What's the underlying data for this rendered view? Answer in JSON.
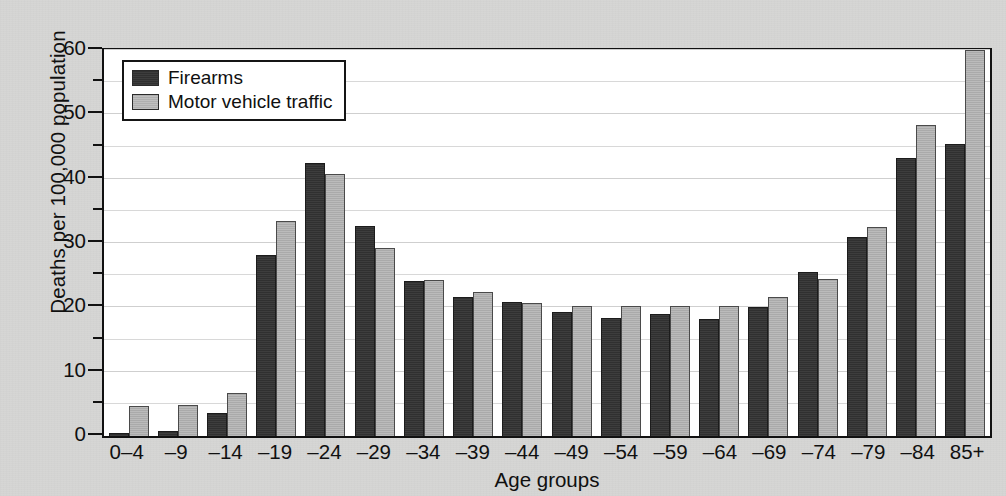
{
  "chart_data": {
    "type": "bar",
    "title": "",
    "subtitle": "",
    "xlabel": "Age groups",
    "ylabel": "Deaths per 100,000 population",
    "ylim": [
      0,
      60
    ],
    "ytick_labels": [
      "0",
      "10",
      "20",
      "30",
      "40",
      "50",
      "60"
    ],
    "ytick_values": [
      0,
      10,
      20,
      30,
      40,
      50,
      60
    ],
    "yminor_values": [
      5,
      15,
      25,
      35,
      45,
      55
    ],
    "grid": true,
    "grid_axis": "y",
    "legend_position": "top-left",
    "categories": [
      "0–4",
      "–9",
      "–14",
      "–19",
      "–24",
      "–29",
      "–34",
      "–39",
      "–44",
      "–49",
      "–54",
      "–59",
      "–64",
      "–69",
      "–74",
      "–79",
      "–84",
      "85+"
    ],
    "series": [
      {
        "name": "Firearms",
        "color": "#333333",
        "values": [
          0.5,
          0.8,
          3.5,
          28.2,
          42.5,
          32.7,
          24.1,
          21.6,
          20.9,
          19.3,
          18.4,
          19.0,
          18.2,
          20.1,
          25.5,
          31.0,
          43.2,
          45.4
        ]
      },
      {
        "name": "Motor vehicle traffic",
        "color": "#b3b3b3",
        "values": [
          4.7,
          4.8,
          6.7,
          33.4,
          40.8,
          29.2,
          24.2,
          22.4,
          20.6,
          20.2,
          20.2,
          20.2,
          20.2,
          21.6,
          24.4,
          32.5,
          48.3,
          60.0
        ]
      }
    ]
  },
  "legend": {
    "items": [
      {
        "label": "Firearms",
        "swatch": "firearms"
      },
      {
        "label": "Motor vehicle traffic",
        "swatch": "mvt"
      }
    ]
  },
  "colors": {
    "page_background": "#d6d6d4",
    "plot_background": "#ffffff",
    "axis": "#111111",
    "gridline": "#d8d8d8",
    "firearms": "#333333",
    "motor_vehicle_traffic": "#b3b3b3"
  }
}
